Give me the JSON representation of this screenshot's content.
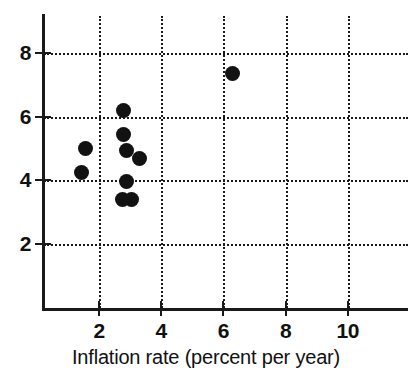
{
  "chart_data": {
    "type": "scatter",
    "title": "",
    "xlabel": "Inflation rate (percent per year)",
    "ylabel": "",
    "xlim": [
      0,
      11.8
    ],
    "ylim": [
      0,
      9.2
    ],
    "xticks": [
      2,
      4,
      6,
      8,
      10
    ],
    "xticklabels": [
      "2",
      "4",
      "6",
      "8",
      "10"
    ],
    "yticks": [
      2,
      4,
      6,
      8
    ],
    "yticklabels": [
      "2",
      "4",
      "6",
      "8"
    ],
    "grid": true,
    "grid_style": "dotted",
    "legend": "none",
    "marker": "filled-circle",
    "marker_color": "#121212",
    "points": [
      {
        "x": 1.55,
        "y": 5.0
      },
      {
        "x": 1.45,
        "y": 4.25
      },
      {
        "x": 2.8,
        "y": 6.2
      },
      {
        "x": 2.8,
        "y": 5.45
      },
      {
        "x": 2.9,
        "y": 4.95
      },
      {
        "x": 3.3,
        "y": 4.7
      },
      {
        "x": 2.9,
        "y": 3.95
      },
      {
        "x": 2.75,
        "y": 3.4
      },
      {
        "x": 3.05,
        "y": 3.4
      },
      {
        "x": 6.3,
        "y": 7.35
      }
    ]
  },
  "axes": {
    "x_title": "Inflation rate (percent per year)",
    "y_title": ""
  },
  "clipped_title": ""
}
